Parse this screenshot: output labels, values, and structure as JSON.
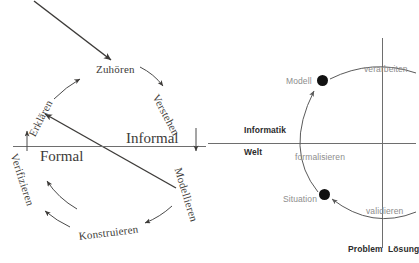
{
  "figure": {
    "left_diagram": {
      "name": "software-engineering-cycle",
      "axis_labels": {
        "left": "Formal",
        "right": "Informal"
      },
      "nodes": [
        {
          "id": "zuhoeren",
          "label": "Zuhören"
        },
        {
          "id": "verstehen",
          "label": "Verstehen"
        },
        {
          "id": "modellieren",
          "label": "Modellieren"
        },
        {
          "id": "konstruieren",
          "label": "Konstruieren"
        },
        {
          "id": "verifizieren",
          "label": "Verifizieren"
        },
        {
          "id": "erklaeren",
          "label": "Erklären"
        }
      ]
    },
    "right_diagram": {
      "name": "modellbildung-quadrant",
      "quadrant_labels": {
        "upper_left": "Informatik",
        "lower_left": "Welt",
        "bottom_left": "Problem",
        "bottom_right": "Lösung"
      },
      "points": [
        {
          "id": "modell",
          "label": "Modell"
        },
        {
          "id": "situation",
          "label": "Situation"
        }
      ],
      "transitions": [
        {
          "id": "verarbeiten",
          "label": "verarbeiten"
        },
        {
          "id": "formalisieren",
          "label": "formalisieren"
        },
        {
          "id": "validieren",
          "label": "validieren"
        }
      ]
    }
  },
  "colors": {
    "ink": "#3d3b39",
    "axis": "#6e6e6e",
    "dot": "#111111",
    "faded": "#8d8d8d"
  }
}
